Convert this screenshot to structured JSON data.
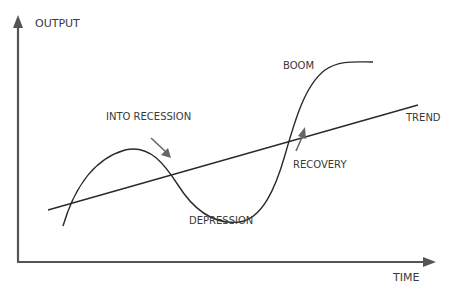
{
  "diagram": {
    "type": "business-cycle",
    "axes": {
      "y_label": "OUTPUT",
      "x_label": "TIME"
    },
    "lines": {
      "trend_label": "TREND"
    },
    "annotations": {
      "into_recession": "INTO RECESSION",
      "depression": "DEPRESSION",
      "recovery": "RECOVERY",
      "boom": "BOOM"
    },
    "colors": {
      "axis": "#555555",
      "curve": "#2a2a2a",
      "arrow": "#666666",
      "text": "#3a3a3a"
    }
  }
}
